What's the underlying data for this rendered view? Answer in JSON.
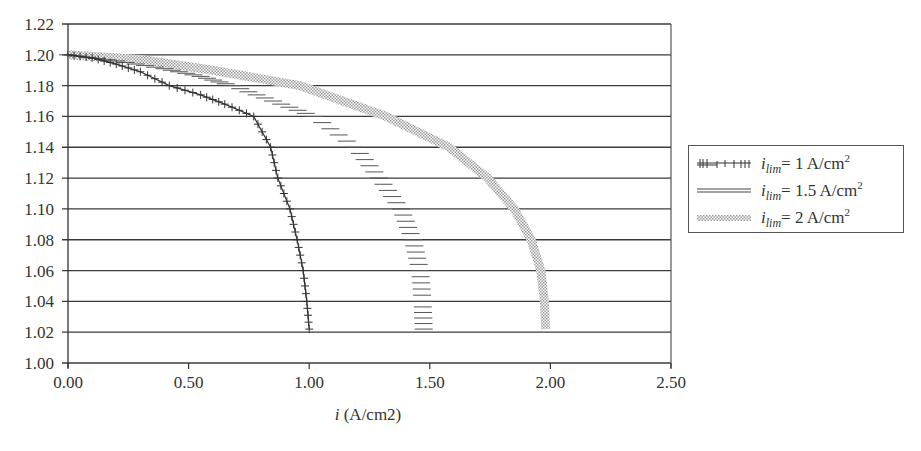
{
  "chart_data": {
    "type": "line",
    "title": "",
    "xlabel": "i (A/cm2)",
    "ylabel": "",
    "xlim": [
      0.0,
      2.5
    ],
    "ylim": [
      1.0,
      1.22
    ],
    "x_ticks": [
      "0.00",
      "0.50",
      "1.00",
      "1.50",
      "2.00",
      "2.50"
    ],
    "y_ticks": [
      "1.00",
      "1.02",
      "1.04",
      "1.06",
      "1.08",
      "1.10",
      "1.12",
      "1.14",
      "1.16",
      "1.18",
      "1.20",
      "1.22"
    ],
    "grid": {
      "horizontal": true,
      "vertical": false
    },
    "legend_position": "right",
    "series": [
      {
        "name": "i_lim = 1 A/cm2",
        "legend_main": "i",
        "legend_sub": "lim",
        "legend_rest": "= 1 A/cm",
        "legend_sup": "2",
        "style": "cross-hatched marker line",
        "color": "#333333",
        "points": [
          [
            0.0,
            1.2
          ],
          [
            0.1,
            1.198
          ],
          [
            0.2,
            1.194
          ],
          [
            0.3,
            1.189
          ],
          [
            0.42,
            1.18
          ],
          [
            0.55,
            1.174
          ],
          [
            0.65,
            1.168
          ],
          [
            0.77,
            1.16
          ],
          [
            0.84,
            1.14
          ],
          [
            0.87,
            1.12
          ],
          [
            0.92,
            1.1
          ],
          [
            0.95,
            1.08
          ],
          [
            0.975,
            1.06
          ],
          [
            0.99,
            1.04
          ],
          [
            1.0,
            1.022
          ]
        ]
      },
      {
        "name": "i_lim = 1.5 A/cm2",
        "legend_main": "i",
        "legend_sub": "lim",
        "legend_rest": "= 1.5 A/cm",
        "legend_sup": "2",
        "style": "dashed horizontal strokes",
        "color": "#555555",
        "points": [
          [
            0.0,
            1.2
          ],
          [
            0.2,
            1.196
          ],
          [
            0.4,
            1.191
          ],
          [
            0.55,
            1.186
          ],
          [
            0.68,
            1.18
          ],
          [
            0.85,
            1.17
          ],
          [
            1.02,
            1.16
          ],
          [
            1.19,
            1.14
          ],
          [
            1.29,
            1.12
          ],
          [
            1.38,
            1.1
          ],
          [
            1.43,
            1.08
          ],
          [
            1.46,
            1.06
          ],
          [
            1.47,
            1.04
          ],
          [
            1.475,
            1.022
          ]
        ]
      },
      {
        "name": "i_lim = 2 A/cm2",
        "legend_main": "i",
        "legend_sub": "lim",
        "legend_rest": "= 2 A/cm",
        "legend_sup": "2",
        "style": "light dotted band",
        "color": "#aaaaaa",
        "points": [
          [
            0.0,
            1.2
          ],
          [
            0.3,
            1.197
          ],
          [
            0.6,
            1.19
          ],
          [
            0.96,
            1.18
          ],
          [
            1.32,
            1.16
          ],
          [
            1.58,
            1.14
          ],
          [
            1.74,
            1.12
          ],
          [
            1.85,
            1.1
          ],
          [
            1.92,
            1.08
          ],
          [
            1.96,
            1.06
          ],
          [
            1.975,
            1.04
          ],
          [
            1.98,
            1.022
          ]
        ]
      }
    ]
  }
}
